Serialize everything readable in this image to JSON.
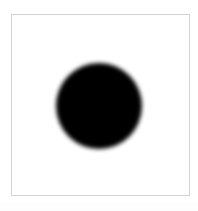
{
  "figure": {
    "name": "black-filled-circle",
    "canvas": {
      "width_px": 198,
      "height_px": 211,
      "background_color": "#ffffff"
    },
    "panel": {
      "label": "plot-panel",
      "left_px": 11,
      "top_px": 14,
      "width_px": 179,
      "height_px": 182,
      "fill_color": "#ffffff",
      "border_color": "#d4d4d4",
      "border_width_px": 1
    },
    "shapes": [
      {
        "id": "disc-1",
        "type": "circle",
        "fill_color": "#000000",
        "center_x_px": 99,
        "center_y_px": 106,
        "radius_px": 43,
        "edge": "soft-blurred",
        "blur_px": 2.1
      }
    ],
    "text": {
      "title": "",
      "caption": ""
    }
  },
  "chart_data": {
    "type": "scatter",
    "title": "",
    "xlabel": "",
    "ylabel": "",
    "grid": false,
    "legend": null,
    "xlim": [
      0,
      179
    ],
    "ylim": [
      0,
      182
    ],
    "tick_labels_x": [],
    "tick_labels_y": [],
    "series": [
      {
        "name": "disc",
        "marker": "circle",
        "color": "#000000",
        "x": [
          88
        ],
        "y": [
          92
        ],
        "size_radius_px": [
          43
        ]
      }
    ],
    "annotations": []
  }
}
